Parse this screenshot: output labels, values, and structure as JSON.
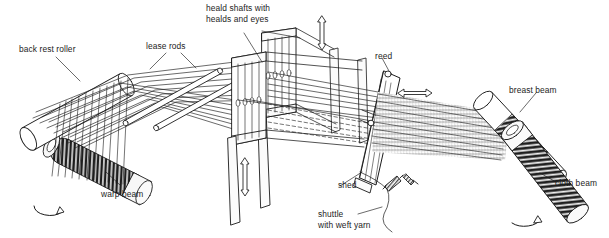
{
  "diagram": {
    "background_color": "#ffffff",
    "line_color": "#1a1a1a",
    "fabric_shade": "#b8b8b8",
    "beam_dark": "#262626",
    "labels": {
      "back_rest_roller": "back rest roller",
      "lease_rods": "lease rods",
      "heald_shafts": "heald shafts with\nhealds and eyes",
      "heald_shafts_line1": "heald shafts with",
      "heald_shafts_line2": "healds and eyes",
      "reed": "reed",
      "breast_beam": "breast beam",
      "cloth_beam": "cloth beam",
      "warp_beam": "warp beam",
      "shed": "shed",
      "shuttle_line1": "shuttle",
      "shuttle_line2": "with weft yarn"
    },
    "parts": [
      {
        "name": "back-rest-roller",
        "label": "back rest roller"
      },
      {
        "name": "lease-rods",
        "label": "lease rods"
      },
      {
        "name": "heald-shafts",
        "label": "heald shafts with healds and eyes"
      },
      {
        "name": "reed",
        "label": "reed"
      },
      {
        "name": "breast-beam",
        "label": "breast beam"
      },
      {
        "name": "cloth-beam",
        "label": "cloth beam"
      },
      {
        "name": "warp-beam",
        "label": "warp beam"
      },
      {
        "name": "shed",
        "label": "shed"
      },
      {
        "name": "shuttle",
        "label": "shuttle with weft yarn"
      }
    ],
    "motion_indicators": [
      {
        "name": "heald-shaft-vertical-arrow-rear",
        "direction": "vertical",
        "double_headed": true
      },
      {
        "name": "heald-shaft-vertical-arrow-front",
        "direction": "vertical",
        "double_headed": true
      },
      {
        "name": "reed-horizontal-arrow",
        "direction": "horizontal",
        "double_headed": true
      },
      {
        "name": "warp-beam-rotation-arrow",
        "direction": "rotational",
        "double_headed": false
      },
      {
        "name": "cloth-beam-rotation-arrow",
        "direction": "rotational",
        "double_headed": false
      }
    ]
  }
}
